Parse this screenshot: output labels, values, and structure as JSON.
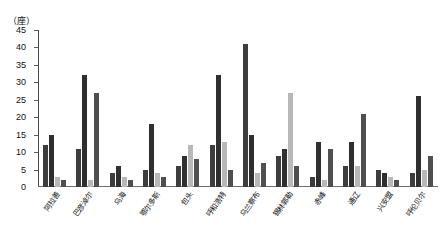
{
  "chart_data": {
    "type": "bar",
    "title": "",
    "subtitle": "",
    "xlabel": "",
    "ylabel": "（座）",
    "unit_label": "（座）",
    "ylim": [
      0,
      45
    ],
    "ytick_labels": [
      "45",
      "40",
      "35",
      "30",
      "25",
      "20",
      "15",
      "10",
      "5",
      "0"
    ],
    "ytick_values": [
      45,
      40,
      35,
      30,
      25,
      20,
      15,
      10,
      5,
      0
    ],
    "grid": false,
    "legend": "none",
    "legend_position": "none",
    "categories": [
      "阿拉善",
      "巴彦淖尔",
      "乌海",
      "鄂尔多斯",
      "包头",
      "呼和浩特",
      "乌兰察布",
      "锡林郭勒",
      "赤峰",
      "通辽",
      "兴安盟",
      "呼伦贝尔"
    ],
    "series": [
      {
        "name": "系列1",
        "color": "#3d3d3d",
        "values": [
          12,
          11,
          4,
          5,
          6,
          12,
          41,
          9,
          3,
          6,
          5,
          4
        ]
      },
      {
        "name": "系列2",
        "color": "#2f2f2f",
        "values": [
          15,
          32,
          6,
          18,
          9,
          32,
          15,
          11,
          13,
          13,
          4,
          26
        ]
      },
      {
        "name": "系列3",
        "color": "#b8b8b8",
        "values": [
          3,
          2,
          3,
          4,
          12,
          13,
          4,
          27,
          2,
          6,
          3,
          5
        ]
      },
      {
        "name": "系列4",
        "color": "#4f4f4f",
        "values": [
          2,
          27,
          2,
          3,
          8,
          5,
          7,
          6,
          11,
          21,
          2,
          9
        ]
      }
    ]
  }
}
